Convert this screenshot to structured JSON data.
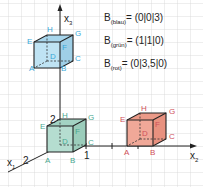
{
  "equations": [
    {
      "var": "B",
      "sub": "(blau)",
      "value": "= (0|0|3)"
    },
    {
      "var": "B",
      "sub": "(grün)",
      "value": "= (1|1|0)"
    },
    {
      "var": "B",
      "sub": "(rot)",
      "value": "= (0|3,5|0)"
    }
  ],
  "axes": {
    "x1": {
      "name": "x",
      "sub": "1"
    },
    "x2": {
      "name": "x",
      "sub": "2"
    },
    "x3": {
      "name": "x",
      "sub": "3"
    },
    "tick_x1": "2",
    "tick_x2": "1",
    "tick_x3": "2"
  },
  "cubes": {
    "blue": {
      "color": "#3aa8d8",
      "fill": "#bfe3f3",
      "labels": [
        "A",
        "B",
        "C",
        "D",
        "E",
        "F",
        "G",
        "H"
      ]
    },
    "green": {
      "color": "#4aa890",
      "fill": "#b5ddd0",
      "labels": [
        "A",
        "B",
        "C",
        "D",
        "E",
        "F",
        "G",
        "H"
      ]
    },
    "red": {
      "color": "#d0505a",
      "fill": "#f0a898",
      "labels": [
        "A",
        "B",
        "C",
        "D",
        "E",
        "F",
        "G",
        "H"
      ]
    }
  }
}
